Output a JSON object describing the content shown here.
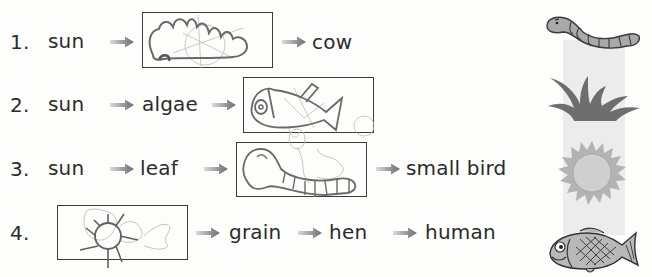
{
  "worksheet": {
    "rows": [
      {
        "number": "1.",
        "items": [
          "sun",
          "[drawing]",
          "cow"
        ],
        "labels": {
          "a": "sun",
          "c": "cow"
        },
        "drawing": "grass-sketch"
      },
      {
        "number": "2.",
        "items": [
          "sun",
          "algae",
          "[drawing]"
        ],
        "labels": {
          "a": "sun",
          "b": "algae"
        },
        "drawing": "fish-sketch"
      },
      {
        "number": "3.",
        "items": [
          "sun",
          "leaf",
          "[drawing]",
          "small bird"
        ],
        "labels": {
          "a": "sun",
          "b": "leaf",
          "d": "small bird"
        },
        "drawing": "worm-sketch"
      },
      {
        "number": "4.",
        "items": [
          "[drawing]",
          "grain",
          "hen",
          "human"
        ],
        "labels": {
          "b": "grain",
          "c": "hen",
          "d": "human"
        },
        "drawing": "sun-sketch"
      }
    ],
    "picture_key": [
      {
        "icon": "worm-icon",
        "color": "#a9a9a9"
      },
      {
        "icon": "grass-icon",
        "color": "#6e6e6e"
      },
      {
        "icon": "sun-icon",
        "color": "#b3b3b3"
      },
      {
        "icon": "fish-icon",
        "color": "#b8b8b8"
      }
    ],
    "colors": {
      "text": "#2b2b2b",
      "arrow_dark": "#7a7a7a",
      "arrow_light": "#d0d0d0",
      "box_border": "#3a3a3a",
      "band": "#ececec",
      "pencil": "#6a6a6a"
    }
  }
}
